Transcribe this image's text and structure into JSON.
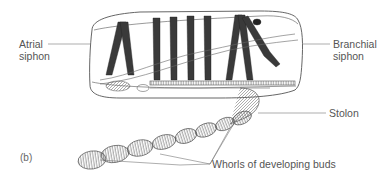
{
  "figure": {
    "panel": "(b)",
    "labels": {
      "atrial_siphon_line1": "Atrial",
      "atrial_siphon_line2": "siphon",
      "branchial_siphon_line1": "Branchial",
      "branchial_siphon_line2": "siphon",
      "stolon": "Stolon",
      "whorls": "Whorls of developing buds"
    },
    "colors": {
      "outline": "#555555",
      "muscle_band": "#3a3a3a",
      "label_text": "#555555",
      "background": "#ffffff"
    }
  }
}
